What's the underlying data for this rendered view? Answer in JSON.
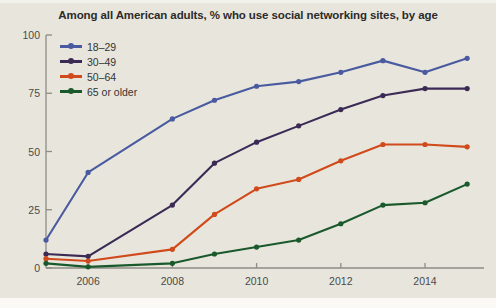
{
  "chart_data": {
    "type": "line",
    "title": "Among all American adults, % who use social networking sites, by age",
    "xlabel": "",
    "ylabel": "",
    "xlim": [
      2005,
      2015.4
    ],
    "ylim": [
      0,
      100
    ],
    "grid": false,
    "legend_position": "top-left",
    "x": [
      2005,
      2006,
      2008,
      2009,
      2010,
      2011,
      2012,
      2013,
      2014,
      2015
    ],
    "xtick_labels": [
      "2006",
      "2008",
      "2010",
      "2012",
      "2014"
    ],
    "xticks": [
      2006,
      2008,
      2010,
      2012,
      2014
    ],
    "ytick_labels": [
      "0",
      "25",
      "50",
      "75",
      "100"
    ],
    "yticks": [
      0,
      25,
      50,
      75,
      100
    ],
    "series": [
      {
        "name": "18–29",
        "color": "#4a5aa0",
        "values": [
          12,
          41,
          64,
          72,
          78,
          80,
          84,
          89,
          84,
          90
        ]
      },
      {
        "name": "30–49",
        "color": "#3b2a55",
        "values": [
          6,
          5,
          27,
          45,
          54,
          61,
          68,
          74,
          77,
          77
        ]
      },
      {
        "name": "50–64",
        "color": "#d04a1c",
        "values": [
          4,
          3,
          8,
          23,
          34,
          38,
          46,
          53,
          53,
          52
        ]
      },
      {
        "name": "65 or older",
        "color": "#19592c",
        "values": [
          2,
          0.5,
          2,
          6,
          9,
          12,
          19,
          27,
          28,
          36
        ]
      }
    ]
  },
  "axis": {
    "line_color": "#8d8d86",
    "tick_color": "#8d8d86"
  },
  "theme": {
    "background": "#e8e6dc",
    "title_color": "#2b2b2b",
    "label_color": "#4a4a4a"
  }
}
